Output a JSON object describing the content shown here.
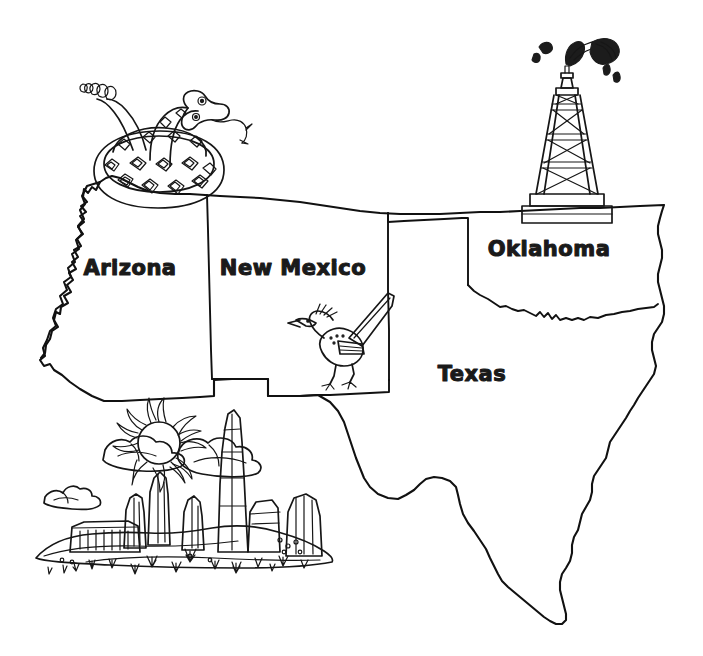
{
  "page": {
    "kind": "line-art-coloring-page",
    "background_color": "#ffffff",
    "ink_color": "#111111",
    "width": 703,
    "height": 656
  },
  "map": {
    "region_name": "American Southwest",
    "states": [
      {
        "id": "arizona",
        "label": "Arizona",
        "label_x": 130,
        "label_y": 275,
        "font_size": 21
      },
      {
        "id": "new-mexico",
        "label": "New Mexico",
        "label_x": 293,
        "label_y": 275,
        "font_size": 21
      },
      {
        "id": "oklahoma",
        "label": "Oklahoma",
        "label_x": 549,
        "label_y": 256,
        "font_size": 21
      },
      {
        "id": "texas",
        "label": "Texas",
        "label_x": 472,
        "label_y": 381,
        "font_size": 21
      }
    ]
  },
  "illustrations": [
    {
      "id": "rattlesnake",
      "name": "coiled-rattlesnake",
      "description": "Coiled rattlesnake with rattle tail raised at left, head with forked tongue at right, diamond-patterned body",
      "placed_over": "arizona",
      "anchor_x": 165,
      "anchor_y": 150
    },
    {
      "id": "oil-derrick",
      "name": "oil-derrick-gusher",
      "description": "Wooden oil derrick tower with cross-braces on a base, oil gusher spraying from the top with droplets",
      "placed_over": "oklahoma",
      "anchor_x": 566,
      "anchor_y": 130
    },
    {
      "id": "roadrunner",
      "name": "roadrunner-bird",
      "description": "Running roadrunner bird with head crest, long beak, speckled body and long tail angled up and right",
      "placed_over": "new-mexico",
      "anchor_x": 350,
      "anchor_y": 345
    },
    {
      "id": "desert-scene",
      "name": "desert-mesa-landscape",
      "description": "Desert landscape with radiating sun, puffy clouds, mesas, buttes and rock spires with scattered grass tufts",
      "placed_over": "below-arizona-and-new-mexico",
      "anchor_x": 200,
      "anchor_y": 490
    }
  ],
  "legend": {
    "note": "No legend, scale bar, compass, or caption is visible on this page."
  }
}
